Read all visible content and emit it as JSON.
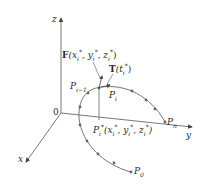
{
  "diagram": {
    "colors": {
      "axis": "#555555",
      "curve": "#666666",
      "point": "#666666",
      "text": "#2a2a2a"
    },
    "axes": {
      "x_label": "x",
      "y_label": "y",
      "z_label": "z",
      "origin_label": "0"
    },
    "labels": {
      "force": {
        "bold": "F",
        "args": "(x",
        "sub1": "i",
        "sup1": "*",
        "mid1": ", y",
        "sub2": "i",
        "sup2": "*",
        "mid2": ", z",
        "sub3": "i",
        "sup3": "*",
        "end": ")"
      },
      "tangent": {
        "bold": "T",
        "args": "(t",
        "sub": "i",
        "sup": "*",
        "end": ")"
      },
      "p_i_minus_1": {
        "base": "P",
        "sub": "i−1"
      },
      "p_i": {
        "base": "P",
        "sub": "i"
      },
      "p_n": {
        "base": "P",
        "sub": "n"
      },
      "p_0": {
        "base": "P",
        "sub": "0"
      },
      "p_i_star": {
        "base": "P",
        "sub": "i",
        "sup": "*",
        "args": "(x",
        "sub1": "i",
        "sup1": "*",
        "mid1": ", y",
        "sub2": "i",
        "sup2": "*",
        "mid2": ", z",
        "sub3": "i",
        "sup3": "*",
        "end": ")"
      }
    }
  }
}
